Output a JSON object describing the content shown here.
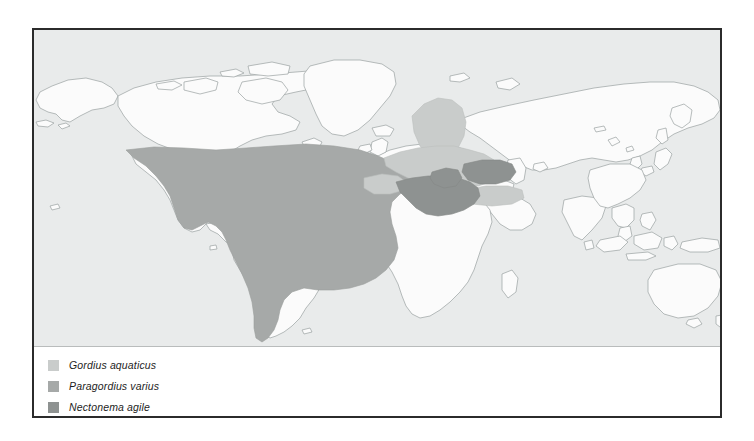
{
  "figure": {
    "type": "distribution-map",
    "projection": "world-equirectangular",
    "ocean_color": "#e9ebeb",
    "land_color": "#fbfbfb",
    "coastline_color": "#9aa0a0",
    "frame_color": "#2b2b2b",
    "legend_background": "#ffffff",
    "divider_color": "#b9bcbc"
  },
  "legend": {
    "items": [
      {
        "label": "Gordius aquaticus",
        "swatch_name": "legend-swatch-gordius-aquaticus",
        "color": "#c9cccb",
        "regions": [
          "Scandinavia",
          "Central Europe",
          "Eastern Europe",
          "Western Russia",
          "Iberia coast",
          "Anatolia"
        ]
      },
      {
        "label": "Paragordius varius",
        "swatch_name": "legend-swatch-paragordius-varius",
        "color": "#a6a9a8",
        "regions": [
          "North America",
          "Central America",
          "South America",
          "North Atlantic Ocean",
          "South Atlantic Ocean",
          "West Africa coast"
        ]
      },
      {
        "label": "Nectonema agile",
        "swatch_name": "legend-swatch-nectonema-agile",
        "color": "#8e9291",
        "regions": [
          "Mediterranean Sea",
          "Black Sea",
          "Southern Europe",
          "Aegean"
        ]
      }
    ]
  },
  "map_regions": {
    "paragordius_varius_color": "#a6a9a8",
    "gordius_aquaticus_color": "#c9cccb",
    "nectonema_agile_color": "#8e9291"
  }
}
